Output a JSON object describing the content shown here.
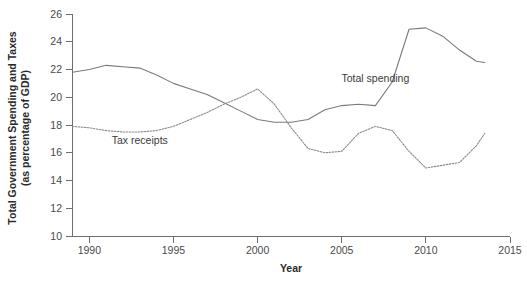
{
  "chart_data": {
    "type": "line",
    "title": "",
    "xlabel": "Year",
    "ylabel": "Total Government Spending and Taxes (as percentage of GDP)",
    "ylabel_line1": "Total Government Spending and Taxes",
    "ylabel_line2": "(as percentage of GDP)",
    "xlim": [
      1989,
      2015
    ],
    "ylim": [
      10,
      26
    ],
    "xticks": [
      1990,
      1995,
      2000,
      2005,
      2010,
      2015
    ],
    "xtick_labels": [
      "1990",
      "1995",
      "2000",
      "2005",
      "2010",
      "2015"
    ],
    "yticks": [
      10,
      12,
      14,
      16,
      18,
      20,
      22,
      24,
      26
    ],
    "ytick_labels": [
      "10",
      "12",
      "14",
      "16",
      "18",
      "20",
      "22",
      "24",
      "26"
    ],
    "grid": false,
    "legend": "inline-annotations",
    "series": [
      {
        "name": "Total spending",
        "style": "solid",
        "color": "#7a7a7a",
        "label_x": 2007.0,
        "label_y": 21.1,
        "x": [
          1989.0,
          1990,
          1991,
          1992,
          1993,
          1994,
          1995,
          1996,
          1997,
          1998,
          1999,
          2000,
          2001,
          2002,
          2003,
          2004,
          2005,
          2006,
          2007,
          2008,
          2009,
          2010,
          2011,
          2012,
          2013,
          2013.5
        ],
        "values": [
          21.8,
          22.0,
          22.3,
          22.2,
          22.1,
          21.6,
          21.0,
          20.6,
          20.2,
          19.6,
          19.0,
          18.4,
          18.2,
          18.2,
          18.4,
          19.1,
          19.4,
          19.5,
          19.4,
          21.1,
          24.9,
          25.0,
          24.4,
          23.4,
          22.6,
          22.5
        ]
      },
      {
        "name": "Tax receipts",
        "style": "dotted",
        "color": "#8c8c8c",
        "label_x": 1993.0,
        "label_y": 16.6,
        "x": [
          1989.0,
          1990,
          1991,
          1992,
          1993,
          1994,
          1995,
          1996,
          1997,
          1998,
          1999,
          2000,
          2001,
          2002,
          2003,
          2004,
          2005,
          2006,
          2007,
          2008,
          2009,
          2010,
          2011,
          2012,
          2013,
          2013.5
        ],
        "values": [
          17.9,
          17.8,
          17.6,
          17.5,
          17.5,
          17.6,
          17.9,
          18.4,
          18.9,
          19.5,
          20.0,
          20.6,
          19.5,
          17.8,
          16.3,
          16.0,
          16.1,
          17.4,
          17.9,
          17.6,
          16.1,
          14.9,
          15.1,
          15.3,
          16.5,
          17.4
        ]
      }
    ]
  }
}
